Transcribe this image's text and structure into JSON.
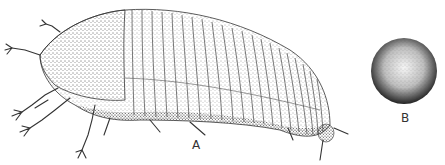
{
  "figure": {
    "panels": [
      {
        "label": "A",
        "subject": "segmented arthropod, lateral view (stipple drawing)"
      },
      {
        "label": "B",
        "subject": "spherical body (stipple drawing)"
      }
    ],
    "colors": {
      "ink": "#222222",
      "background": "#ffffff"
    }
  }
}
